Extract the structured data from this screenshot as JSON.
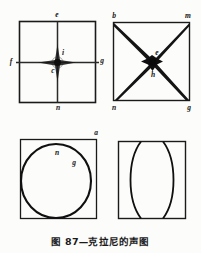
{
  "figure": {
    "caption": "图 87—克拉尼的声图",
    "panels": [
      {
        "id": "panel-cross",
        "position": "top-left",
        "shape": "square-with-cross",
        "description": "Square plate with a vertical and a horizontal nodal line crossing at the centre",
        "labels": [
          {
            "text": "e",
            "x": 57,
            "y": 17,
            "anchor": "middle"
          },
          {
            "text": "f",
            "x": 11,
            "y": 64,
            "anchor": "middle"
          },
          {
            "text": "g",
            "x": 102,
            "y": 63,
            "anchor": "middle"
          },
          {
            "text": "n",
            "x": 58,
            "y": 110,
            "anchor": "middle"
          },
          {
            "text": "i",
            "x": 62,
            "y": 55,
            "anchor": "middle"
          },
          {
            "text": "c",
            "x": 53,
            "y": 72,
            "anchor": "middle"
          }
        ]
      },
      {
        "id": "panel-diagonals",
        "position": "top-right",
        "shape": "square-with-diagonals",
        "description": "Square plate with two diagonal nodal lines forming an X through the centre",
        "labels": [
          {
            "text": "b",
            "x": 114,
            "y": 17,
            "anchor": "middle"
          },
          {
            "text": "m",
            "x": 188,
            "y": 17,
            "anchor": "middle"
          },
          {
            "text": "n",
            "x": 114,
            "y": 110,
            "anchor": "middle"
          },
          {
            "text": "g",
            "x": 189,
            "y": 110,
            "anchor": "middle"
          },
          {
            "text": "e",
            "x": 156,
            "y": 56,
            "anchor": "middle"
          },
          {
            "text": "h",
            "x": 153,
            "y": 75,
            "anchor": "middle"
          }
        ]
      },
      {
        "id": "panel-circle",
        "position": "bottom-left",
        "shape": "square-with-inscribed-circle",
        "description": "Square plate with a circular nodal line inscribed inside it",
        "labels": [
          {
            "text": "a",
            "x": 96,
            "y": 133,
            "anchor": "middle"
          },
          {
            "text": "n",
            "x": 57,
            "y": 154,
            "anchor": "middle"
          },
          {
            "text": "g",
            "x": 73,
            "y": 164,
            "anchor": "middle"
          }
        ]
      },
      {
        "id": "panel-lens",
        "position": "bottom-right",
        "shape": "square-with-two-arcs",
        "description": "Square plate with two opposed curved nodal lines forming a lens shape",
        "labels": []
      }
    ]
  },
  "colors": {
    "ink": "#121212",
    "paper": "#fcfcfa",
    "line": "#1a1a1a"
  }
}
